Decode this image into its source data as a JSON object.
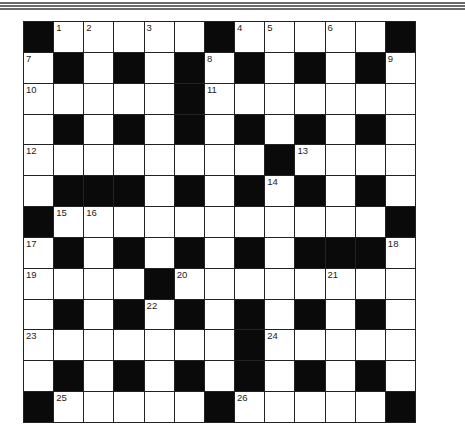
{
  "puzzle": {
    "type": "crossword",
    "size": {
      "rows": 13,
      "cols": 13
    },
    "legend": {
      "B": "black square",
      "W": "white square",
      "number": "white square with clue number"
    },
    "grid": [
      [
        "B",
        "1",
        "2",
        "W",
        "3",
        "W",
        "B",
        "4",
        "5",
        "W",
        "6",
        "W",
        "B"
      ],
      [
        "7",
        "B",
        "W",
        "B",
        "W",
        "B",
        "8",
        "B",
        "W",
        "B",
        "W",
        "B",
        "9"
      ],
      [
        "10",
        "W",
        "W",
        "W",
        "W",
        "B",
        "11",
        "W",
        "W",
        "W",
        "W",
        "W",
        "W"
      ],
      [
        "W",
        "B",
        "W",
        "B",
        "W",
        "B",
        "W",
        "B",
        "W",
        "B",
        "W",
        "B",
        "W"
      ],
      [
        "12",
        "W",
        "W",
        "W",
        "W",
        "W",
        "W",
        "W",
        "B",
        "13",
        "W",
        "W",
        "W"
      ],
      [
        "W",
        "B",
        "B",
        "B",
        "W",
        "B",
        "W",
        "B",
        "14",
        "B",
        "W",
        "B",
        "W"
      ],
      [
        "B",
        "15",
        "16",
        "W",
        "W",
        "W",
        "W",
        "W",
        "W",
        "W",
        "W",
        "W",
        "B"
      ],
      [
        "17",
        "B",
        "W",
        "B",
        "W",
        "B",
        "W",
        "B",
        "W",
        "B",
        "B",
        "B",
        "18"
      ],
      [
        "19",
        "W",
        "W",
        "W",
        "B",
        "20",
        "W",
        "W",
        "W",
        "W",
        "21",
        "W",
        "W"
      ],
      [
        "W",
        "B",
        "W",
        "B",
        "22",
        "B",
        "W",
        "B",
        "W",
        "B",
        "W",
        "B",
        "W"
      ],
      [
        "23",
        "W",
        "W",
        "W",
        "W",
        "W",
        "W",
        "B",
        "24",
        "W",
        "W",
        "W",
        "W"
      ],
      [
        "W",
        "B",
        "W",
        "B",
        "W",
        "B",
        "W",
        "B",
        "W",
        "B",
        "W",
        "B",
        "W"
      ],
      [
        "B",
        "25",
        "W",
        "W",
        "W",
        "W",
        "B",
        "26",
        "W",
        "W",
        "W",
        "W",
        "B"
      ]
    ],
    "clue_numbers": [
      1,
      2,
      3,
      4,
      5,
      6,
      7,
      8,
      9,
      10,
      11,
      12,
      13,
      14,
      15,
      16,
      17,
      18,
      19,
      20,
      21,
      22,
      23,
      24,
      25,
      26
    ]
  },
  "colors": {
    "black_square": "#0a0a0a",
    "white_square": "#ffffff",
    "grid_line": "#222222",
    "header_rule": "#6a6a6a"
  }
}
